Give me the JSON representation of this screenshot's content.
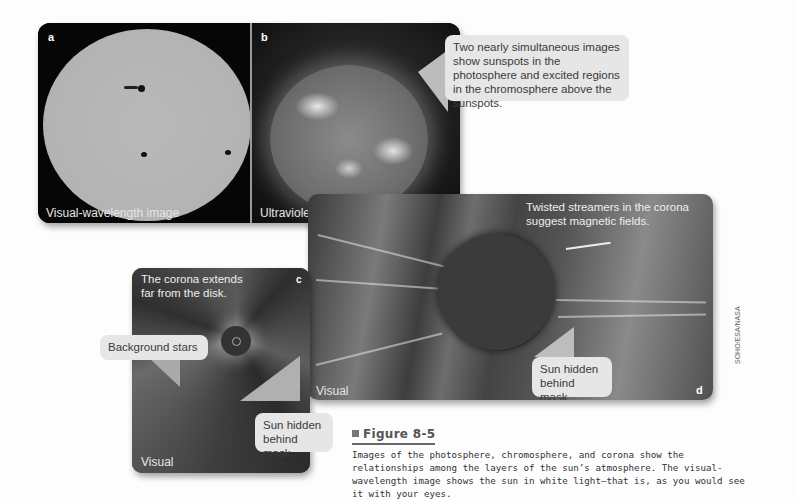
{
  "figure": {
    "title_prefix": "Figure",
    "number": "8-5",
    "title": "Figure 8-5",
    "caption": "Images of the photosphere, chromosphere, and corona show the relationships among the layers of the sun’s atmosphere. The visual-wavelength image shows the sun in white light—that is, as you would see it with your eyes.",
    "credit": "SOHO/ESA/NASA"
  },
  "panels": {
    "a": {
      "label": "a",
      "caption": "Visual-wavelength image"
    },
    "b": {
      "label": "b",
      "caption": "Ultraviolet"
    },
    "c": {
      "label": "c",
      "caption": "Visual",
      "note": "The corona extends far from the disk."
    },
    "d": {
      "label": "d",
      "caption": "Visual",
      "note": "Twisted streamers in the corona suggest magnetic fields."
    }
  },
  "callouts": {
    "top": "Two nearly simultaneous images show sunspots in the photosphere and excited regions in the chromosphere above the sunspots.",
    "background_stars": "Background stars",
    "sun_hidden_c": "Sun hidden behind mask",
    "sun_hidden_d": "Sun hidden behind mask"
  },
  "colors": {
    "callout_bg": "#e6e6e6",
    "panel_dark": "#050505",
    "caption_text": "#333333"
  }
}
